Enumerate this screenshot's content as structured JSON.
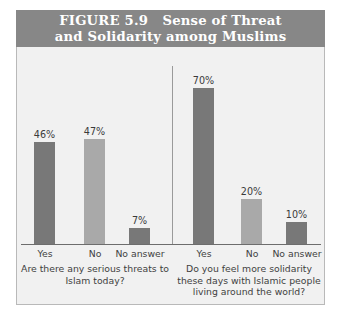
{
  "figure": {
    "title_line1": "FIGURE 5.9   Sense of Threat",
    "title_line2": "and Solidarity among Muslims",
    "banner_color": "#878787",
    "plot_background": "#f1f1f1"
  },
  "chart_data": {
    "type": "bar",
    "title": "FIGURE 5.9   Sense of Threat and Solidarity among Muslims",
    "xlabel": "",
    "ylabel": "",
    "ylim": [
      0,
      80
    ],
    "grid": false,
    "legend": "none",
    "value_suffix": "%",
    "colors": {
      "dark": "#787878",
      "light": "#a9a9a9"
    },
    "groups": [
      {
        "question": "Are there any serious threats to Islam today?",
        "question_line1": "Are there any serious threats to",
        "question_line2": "Islam today?",
        "categories": [
          "Yes",
          "No",
          "No answer"
        ],
        "values": [
          46,
          47,
          7
        ],
        "value_labels": [
          "46%",
          "47%",
          "7%"
        ],
        "bar_shades": [
          "dark",
          "light",
          "dark"
        ]
      },
      {
        "question": "Do you feel more solidarity these days with Islamic people living around the world?",
        "question_line1": "Do you feel more solidarity",
        "question_line2": "these days with Islamic people",
        "question_line3": "living around the world?",
        "categories": [
          "Yes",
          "No",
          "No answer"
        ],
        "values": [
          70,
          20,
          10
        ],
        "value_labels": [
          "70%",
          "20%",
          "10%"
        ],
        "bar_shades": [
          "dark",
          "light",
          "dark"
        ]
      }
    ]
  }
}
